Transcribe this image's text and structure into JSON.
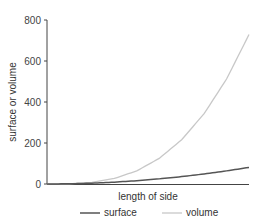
{
  "chart_data": {
    "type": "line",
    "title": "",
    "xlabel": "length of side",
    "ylabel": "surface or volume",
    "ylim": [
      0,
      800
    ],
    "yticks": [
      0,
      200,
      400,
      600,
      800
    ],
    "xlim": [
      0,
      9
    ],
    "grid": false,
    "legend_position": "bottom",
    "x": [
      0,
      1,
      2,
      3,
      4,
      5,
      6,
      7,
      8,
      9
    ],
    "series": [
      {
        "name": "surface",
        "color": "#555555",
        "values": [
          0,
          1,
          4,
          9,
          16,
          25,
          36,
          49,
          64,
          81
        ]
      },
      {
        "name": "volume",
        "color": "#c8c8c8",
        "values": [
          0,
          1,
          8,
          27,
          64,
          125,
          216,
          343,
          512,
          729
        ]
      }
    ]
  }
}
